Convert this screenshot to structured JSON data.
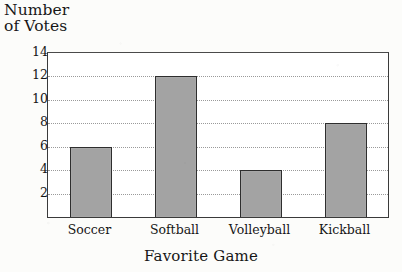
{
  "chart_data": {
    "type": "bar",
    "title": "",
    "categories": [
      "Soccer",
      "Softball",
      "Volleyball",
      "Kickball"
    ],
    "values": [
      6,
      12,
      4,
      8
    ],
    "series": [
      {
        "name": "Number of Votes",
        "values": [
          6,
          12,
          4,
          8
        ]
      }
    ],
    "xlabel": "Favorite Game",
    "ylabel": "Number\nof Votes",
    "ylabel_lines": [
      "Number",
      "of Votes"
    ],
    "ylim": [
      0,
      14
    ],
    "ytick_labels": [
      "2",
      "4",
      "6",
      "8",
      "10",
      "12",
      "14"
    ],
    "ytick_values": [
      2,
      4,
      6,
      8,
      10,
      12,
      14
    ],
    "ytick_interval": 2,
    "grid": true,
    "grid_style": "dotted",
    "legend": false,
    "legend_position": "none",
    "orientation": "vertical",
    "bar_fill_color": "#a3a3a3",
    "bar_edge_color": "#2e2e2e",
    "plot_background": "#ffffff",
    "page_background": "#fcfcfa",
    "axis_color": "#3a3a3a",
    "gridline_color": "#9a9a9a"
  }
}
